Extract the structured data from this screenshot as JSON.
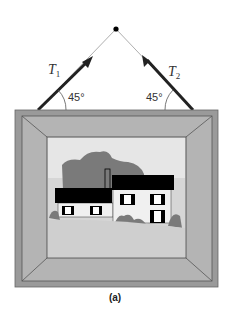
{
  "figure": {
    "caption": "(a)",
    "tension_left": {
      "symbol": "T",
      "subscript": "1"
    },
    "tension_right": {
      "symbol": "T",
      "subscript": "2"
    },
    "angle_left": "45°",
    "angle_right": "45°"
  },
  "colors": {
    "frame_outer": "#9a9a9a",
    "frame_bevel": "#b4b4b4",
    "picture_bg": "#d6d6d6",
    "tree": "#7a7a7a",
    "roof": "#000000",
    "wire": "#222222"
  }
}
